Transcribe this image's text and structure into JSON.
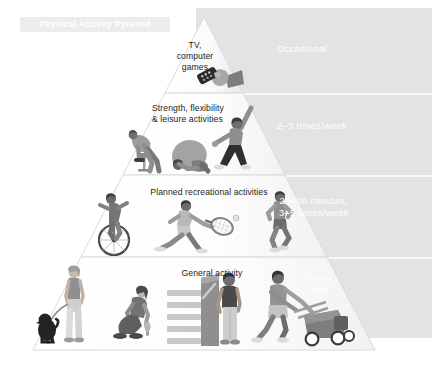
{
  "title": "Physical Activity Pyramid",
  "colors": {
    "panel_gray": "#e3e3e3",
    "pyramid_light": "#fdfdfd",
    "pyramid_edge": "#d7d7d7",
    "rule_white": "#f7f7f7",
    "text_dark": "#1c1c1c",
    "text_white": "#ffffff",
    "figure_dark": "#5e5e5e",
    "figure_mid": "#8e8e8e",
    "figure_light": "#bcbcbc"
  },
  "tiers": [
    {
      "index": 1,
      "name": "occasional",
      "activity_label": "TV,\ncomputer\ngames",
      "frequency_label": "Occasional",
      "icons": [
        "hand-remote-icon"
      ]
    },
    {
      "index": 2,
      "name": "strength-flexibility",
      "activity_label": "Strength, flexibility\n& leisure activities",
      "frequency_label": "2–3 times/week",
      "icons": [
        "weight-lifter-icon",
        "stretching-icon",
        "martial-arts-icon"
      ]
    },
    {
      "index": 3,
      "name": "planned-recreational",
      "activity_label": "Planned recreational activities",
      "frequency_label": "20–30 minutes,\n3–5 times/week",
      "icons": [
        "cyclist-icon",
        "tennis-player-icon",
        "runner-icon"
      ]
    },
    {
      "index": 4,
      "name": "general-activity",
      "activity_label": "General activity",
      "frequency_label": "Every\nday",
      "icons": [
        "dog-walker-icon",
        "gardener-icon",
        "stair-climber-icon",
        "lawn-mower-icon"
      ]
    }
  ]
}
